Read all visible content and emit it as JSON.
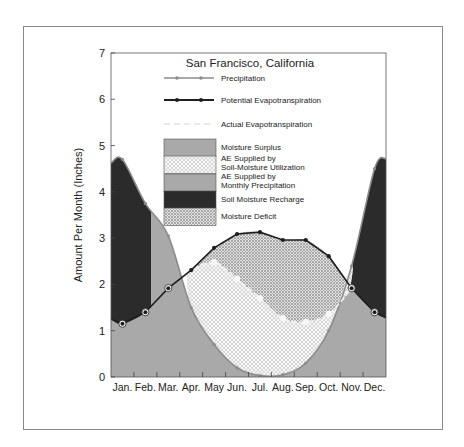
{
  "chart_data": {
    "type": "line",
    "title": "San Francisco, California",
    "xlabel": "",
    "ylabel": "Amount Per Month (Inches)",
    "ylim": [
      0,
      7
    ],
    "yticks": [
      0,
      1,
      2,
      3,
      4,
      5,
      6,
      7
    ],
    "categories": [
      "Jan.",
      "Feb.",
      "Mar.",
      "Apr.",
      "May",
      "Jun.",
      "Jul.",
      "Aug.",
      "Sep.",
      "Oct.",
      "Nov.",
      "Dec."
    ],
    "grid": false,
    "series": [
      {
        "name": "Precipitation",
        "values": [
          4.7,
          3.75,
          3.05,
          1.5,
          0.7,
          0.2,
          0.03,
          0.05,
          0.3,
          1.0,
          2.4,
          4.5
        ]
      },
      {
        "name": "Potential Evapotranspiration",
        "values": [
          1.15,
          1.4,
          1.92,
          2.31,
          2.79,
          3.09,
          3.13,
          2.96,
          2.96,
          2.61,
          1.92,
          1.4
        ]
      },
      {
        "name": "Actual Evapotranspiration",
        "values": [
          1.15,
          1.4,
          1.92,
          2.31,
          2.48,
          2.12,
          1.7,
          1.27,
          1.19,
          1.36,
          1.92,
          1.4
        ]
      }
    ],
    "area_legend": [
      {
        "name": "Moisture Surplus",
        "pattern": "medium-grey"
      },
      {
        "name": "AE Supplied by Soil-Moisture Utilization",
        "pattern": "crosshatch"
      },
      {
        "name": "AE Supplied by Monthly Precipitation",
        "pattern": "medium-grey"
      },
      {
        "name": "Soil Moisture Recharge",
        "pattern": "dark"
      },
      {
        "name": "Moisture Deficit",
        "pattern": "dots"
      }
    ],
    "legend_position": "upper center inside plot"
  },
  "labels": {
    "title": "San Francisco, California",
    "ylabel": "Amount Per Month (Inches)",
    "legend_lines": [
      "Precipitation",
      "Potential Evapotranspiration",
      "Actual Evapotranspiration"
    ],
    "legend_areas": [
      [
        "Moisture Surplus"
      ],
      [
        "AE Supplied by",
        "Soil-Moisture Utilization"
      ],
      [
        "AE Supplied by",
        "Monthly Precipitation"
      ],
      [
        "Soil Moisture Recharge"
      ],
      [
        "Moisture Deficit"
      ]
    ]
  },
  "colors": {
    "medium_grey": "#a9a9a9",
    "dark": "#2b2b2b",
    "precip_line": "#8c8c8c",
    "pe_line": "#1e1e1e",
    "ae_line": "#f2f2f2",
    "frame": "#8a8a8a"
  }
}
